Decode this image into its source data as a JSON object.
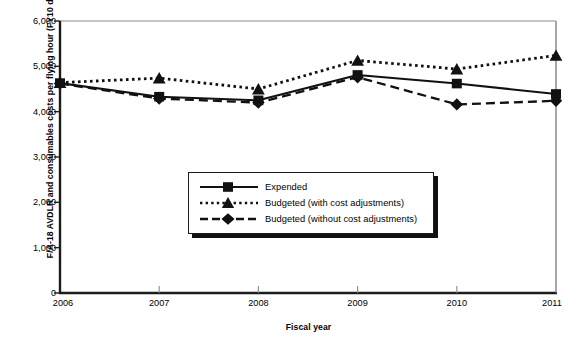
{
  "chart_data": {
    "type": "line",
    "title": "",
    "xlabel": "Fiscal year",
    "ylabel": "F/A-18 AVDLR and consumables costs per flying hour (FY10 dollars)",
    "categories": [
      "2006",
      "2007",
      "2008",
      "2009",
      "2010",
      "2011"
    ],
    "xticklabels": [
      "2006",
      "2007",
      "2008",
      "2009",
      "2010",
      "2011"
    ],
    "yticklabels": [
      "0",
      "1,000",
      "2,000",
      "3,000",
      "4,000",
      "5,000",
      "6,000"
    ],
    "ytickvalues": [
      0,
      1000,
      2000,
      3000,
      4000,
      5000,
      6000
    ],
    "ylim": [
      0,
      6000
    ],
    "grid": false,
    "legend_position": "center-inside",
    "series": [
      {
        "name": "Expended",
        "marker": "square",
        "linestyle": "solid",
        "values": [
          4630,
          4330,
          4250,
          4810,
          4620,
          4390
        ]
      },
      {
        "name": "Budgeted (with cost adjustments)",
        "marker": "triangle",
        "linestyle": "dotted",
        "values": [
          4640,
          4740,
          4500,
          5130,
          4940,
          5240
        ]
      },
      {
        "name": "Budgeted (without cost adjustments)",
        "marker": "diamond",
        "linestyle": "dashed",
        "values": [
          4620,
          4290,
          4200,
          4760,
          4160,
          4240
        ]
      }
    ]
  },
  "colors": {
    "ink": "#111111",
    "axis": "#1c1c1c",
    "frame": "#8a8a8a",
    "background": "#ffffff"
  }
}
